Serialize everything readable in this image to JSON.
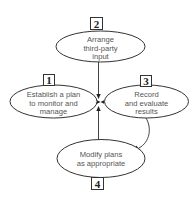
{
  "diagram": {
    "type": "cycle",
    "nodes": [
      {
        "id": 1,
        "number": "1",
        "lines": [
          "Establish a plan",
          "to monitor and",
          "manage"
        ]
      },
      {
        "id": 2,
        "number": "2",
        "lines": [
          "Arrange",
          "third-party",
          "input"
        ]
      },
      {
        "id": 3,
        "number": "3",
        "lines": [
          "Record",
          "and evaluate",
          "results"
        ]
      },
      {
        "id": 4,
        "number": "4",
        "lines": [
          "Modify plans",
          "as appropriate"
        ]
      }
    ],
    "edges": [
      {
        "from": 2,
        "to": "center",
        "label": ""
      },
      {
        "from": 4,
        "to": "center",
        "label": ""
      },
      {
        "from": 1,
        "to": "center",
        "label": ""
      },
      {
        "from": 3,
        "to": "center",
        "label": ""
      },
      {
        "from": 3,
        "to": 4,
        "label": ""
      }
    ],
    "colors": {
      "stroke": "#333333",
      "text": "#555555",
      "number": "#222222",
      "background": "#ffffff"
    }
  }
}
